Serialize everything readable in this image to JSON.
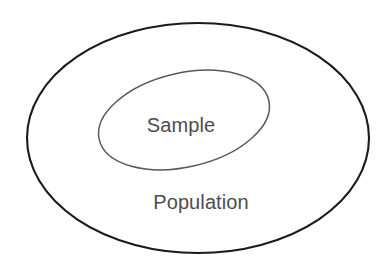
{
  "figure": {
    "background_color": "#ffffff",
    "width": 391,
    "height": 266
  },
  "diagram": {
    "type": "venn",
    "shapes": [
      {
        "id": "population-ellipse",
        "label": "Population",
        "cx": 198,
        "cy": 138,
        "rx": 171,
        "ry": 115,
        "rotation": 0,
        "stroke_color": "#1a1a1a",
        "stroke_width": 2.1,
        "fill": "none"
      },
      {
        "id": "sample-ellipse",
        "label": "Sample",
        "cx": 184,
        "cy": 120,
        "rx": 87,
        "ry": 47,
        "rotation": -13,
        "stroke_color": "#595959",
        "stroke_width": 1.5,
        "fill": "none"
      }
    ],
    "labels": [
      {
        "id": "sample-label",
        "text": "Sample",
        "x": 181,
        "y": 132,
        "color": "#4d4d4d",
        "font_size": 20
      },
      {
        "id": "population-label",
        "text": "Population",
        "x": 201,
        "y": 209,
        "color": "#4d4d4d",
        "font_size": 20
      }
    ]
  }
}
